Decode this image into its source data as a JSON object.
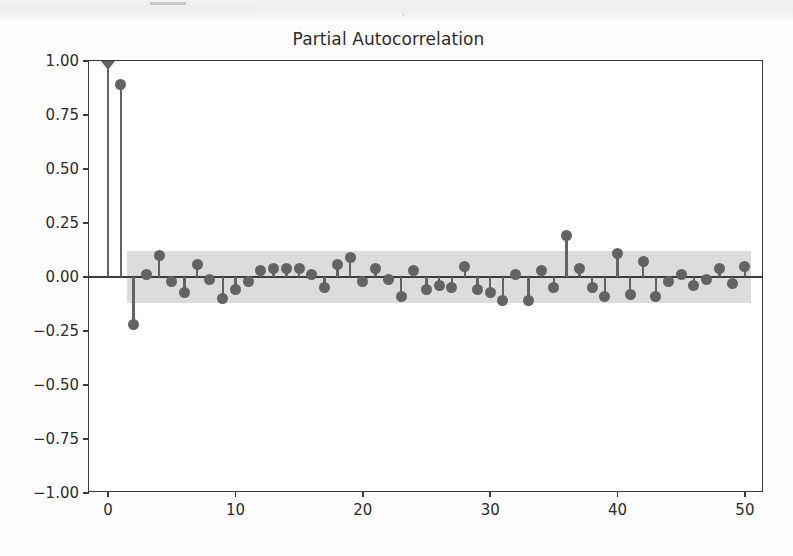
{
  "page": {
    "background_color": "#fefefe",
    "scan_artifact": true
  },
  "chart_data": {
    "type": "stem",
    "title": "Partial Autocorrelation",
    "xlabel": "",
    "ylabel": "",
    "xlim": [
      -1.5,
      51.5
    ],
    "ylim": [
      -1.0,
      1.0
    ],
    "grid": false,
    "legend": null,
    "series_color": "#636363",
    "axis_color": "#3a3a3a",
    "confidence_band_color": "#d6d6d6",
    "confidence_band": {
      "upper": 0.12,
      "lower": -0.12,
      "x_start": 1.5,
      "x_end": 50.5
    },
    "ytick_labels": [
      "1.00",
      "0.75",
      "0.50",
      "0.25",
      "0.00",
      "-0.25",
      "-0.50",
      "-0.75",
      "-1.00"
    ],
    "ytick_values": [
      1.0,
      0.75,
      0.5,
      0.25,
      0.0,
      -0.25,
      -0.5,
      -0.75,
      -1.0
    ],
    "xtick_labels": [
      "0",
      "10",
      "20",
      "30",
      "40",
      "50"
    ],
    "xtick_values": [
      0,
      10,
      20,
      30,
      40,
      50
    ],
    "x": [
      0,
      1,
      2,
      3,
      4,
      5,
      6,
      7,
      8,
      9,
      10,
      11,
      12,
      13,
      14,
      15,
      16,
      17,
      18,
      19,
      20,
      21,
      22,
      23,
      24,
      25,
      26,
      27,
      28,
      29,
      30,
      31,
      32,
      33,
      34,
      35,
      36,
      37,
      38,
      39,
      40,
      41,
      42,
      43,
      44,
      45,
      46,
      47,
      48,
      49,
      50
    ],
    "values": [
      1.0,
      0.89,
      -0.22,
      0.01,
      0.1,
      -0.02,
      -0.07,
      0.06,
      -0.01,
      -0.1,
      -0.06,
      -0.02,
      0.03,
      0.04,
      0.04,
      0.04,
      0.01,
      -0.05,
      0.06,
      0.09,
      -0.02,
      0.04,
      -0.01,
      -0.09,
      0.03,
      -0.06,
      -0.04,
      -0.05,
      0.05,
      -0.06,
      -0.07,
      -0.11,
      0.01,
      -0.11,
      0.03,
      -0.05,
      0.19,
      0.04,
      -0.05,
      -0.09,
      0.11,
      -0.08,
      0.07,
      -0.09,
      -0.02,
      0.01,
      -0.04,
      -0.01,
      0.04,
      -0.03,
      0.05
    ]
  }
}
